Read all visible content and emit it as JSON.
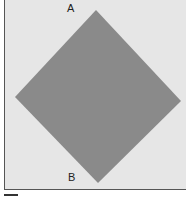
{
  "diagram": {
    "shape": "diamond",
    "fill_color": "#8a8a8a",
    "background_color": "#e6e6e6",
    "vertices": {
      "top": [
        95,
        10
      ],
      "right": [
        180,
        101
      ],
      "bottom": [
        97,
        183
      ],
      "left": [
        14,
        97
      ]
    },
    "labels": {
      "top": "A",
      "bottom": "B"
    }
  }
}
